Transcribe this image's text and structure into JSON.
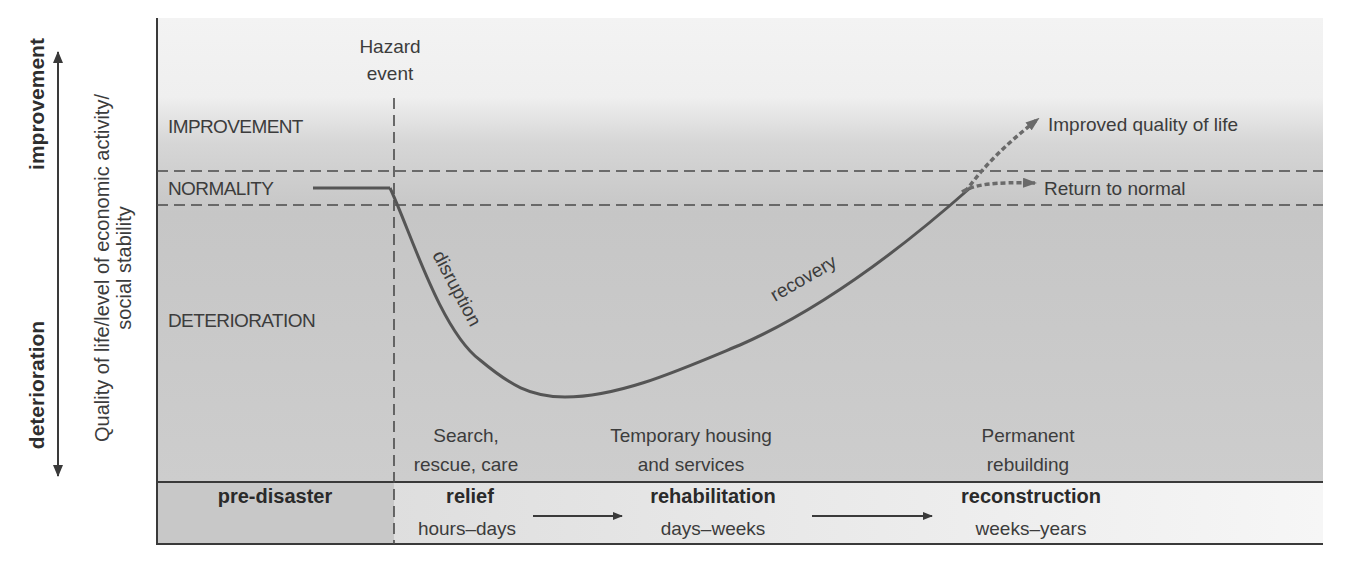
{
  "diagram": {
    "axis": {
      "up_label": "improvement",
      "down_label": "deterioration",
      "y_label_line1": "Quality of life/level of economic activity/",
      "y_label_line2": "social stability"
    },
    "regions": {
      "improvement": "IMPROVEMENT",
      "normality": "NORMALITY",
      "deterioration": "DETERIORATION"
    },
    "hazard": {
      "line1": "Hazard",
      "line2": "event"
    },
    "curve_labels": {
      "disruption": "disruption",
      "recovery": "recovery"
    },
    "outcomes": {
      "improved": "Improved quality of life",
      "normal": "Return to normal"
    },
    "activities": [
      {
        "line1": "Search,",
        "line2": "rescue, care"
      },
      {
        "line1": "Temporary housing",
        "line2": "and services"
      },
      {
        "line1": "Permanent",
        "line2": "rebuilding"
      }
    ],
    "phases": [
      {
        "name": "pre-disaster",
        "duration": ""
      },
      {
        "name": "relief",
        "duration": "hours–days"
      },
      {
        "name": "rehabilitation",
        "duration": "days–weeks"
      },
      {
        "name": "reconstruction",
        "duration": "weeks–years"
      }
    ],
    "colors": {
      "line": "#4a4a4a",
      "dotted_arrow": "#6a6a6a",
      "bg_light": "#f2f2f2",
      "bg_dark": "#c9c9c9",
      "band_pre": "#c6c6c6",
      "band_light": "#ececec"
    }
  }
}
